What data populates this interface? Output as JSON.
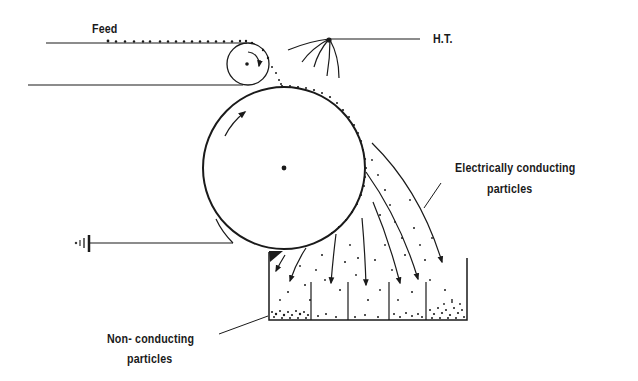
{
  "diagram": {
    "type": "electrostatic separator schematic",
    "labels": {
      "feed": "Feed",
      "high_tension": "H.T.",
      "conducting_line1": "Electrically conducting",
      "conducting_line2": "particles",
      "nonconducting_line1": "Non- conducting",
      "nonconducting_line2": "particles"
    },
    "components": [
      {
        "name": "feed-belt",
        "description": "horizontal conveyor lines carrying feed particles"
      },
      {
        "name": "feed-roller",
        "description": "small rotating roller at end of feed belt, clockwise"
      },
      {
        "name": "main-drum",
        "description": "large grounded rotating drum, clockwise"
      },
      {
        "name": "high-tension-electrode",
        "description": "corona electrode fan wires connected to H.T. line"
      },
      {
        "name": "ground-connection",
        "description": "earth symbol with line to brush contacting drum"
      },
      {
        "name": "collection-bins",
        "description": "collection tray with vertical dividers, 5 compartments"
      }
    ],
    "colors": {
      "ink": "#1a1a1a",
      "background": "#ffffff"
    }
  }
}
